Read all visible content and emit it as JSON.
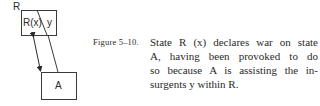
{
  "diagram": {
    "outer_label": "R",
    "box_r": {
      "left_label": "R(x)",
      "right_label": "y"
    },
    "box_a": {
      "label": "A"
    },
    "colors": {
      "stroke": "#3a3a3a",
      "text": "#2a2a2a"
    }
  },
  "caption": {
    "figure_label": "Figure 5–10.",
    "lines": [
      "State R (x) declares war on state",
      "A, having been provoked to do",
      "so because A is assisting the in-",
      "surgents y within R."
    ]
  }
}
